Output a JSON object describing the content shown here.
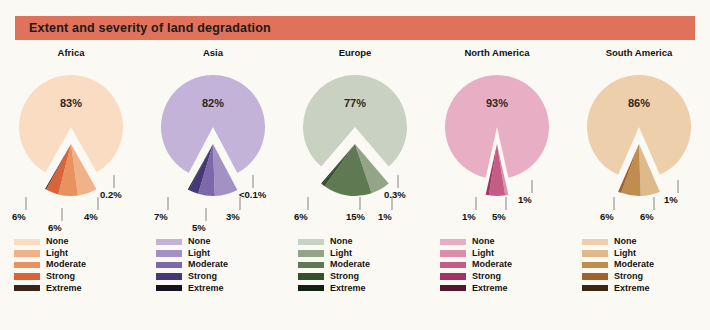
{
  "header": {
    "title": "Extent and severity of land degradation"
  },
  "legend_labels": [
    "None",
    "Light",
    "Moderate",
    "Strong",
    "Extreme"
  ],
  "chart_data": [
    {
      "type": "pie",
      "title": "Africa",
      "categories": [
        "None",
        "Light",
        "Moderate",
        "Strong",
        "Extreme"
      ],
      "values": [
        83,
        6,
        6,
        4,
        0.2
      ],
      "value_labels": [
        "83%",
        "6%",
        "6%",
        "4%",
        "0.2%"
      ],
      "colors": [
        "#fadcc3",
        "#f0b288",
        "#e8925f",
        "#d9643a",
        "#3a2318"
      ],
      "legend_colors": [
        "#fadcc3",
        "#f0b288",
        "#e8925f",
        "#d9643a",
        "#3a2318"
      ]
    },
    {
      "type": "pie",
      "title": "Asia",
      "categories": [
        "None",
        "Light",
        "Moderate",
        "Strong",
        "Extreme"
      ],
      "values": [
        82,
        7,
        5,
        3,
        0.05
      ],
      "value_labels": [
        "82%",
        "7%",
        "5%",
        "3%",
        "<0.1%"
      ],
      "colors": [
        "#c3b3d8",
        "#a391c4",
        "#7c69aa",
        "#443a7a",
        "#14121f"
      ],
      "legend_colors": [
        "#c3b3d8",
        "#a391c4",
        "#7c69aa",
        "#443a7a",
        "#14121f"
      ]
    },
    {
      "type": "pie",
      "title": "Europe",
      "categories": [
        "None",
        "Light",
        "Moderate",
        "Strong",
        "Extreme"
      ],
      "values": [
        77,
        6,
        15,
        1,
        0.3
      ],
      "value_labels": [
        "77%",
        "6%",
        "15%",
        "1%",
        "0.3%"
      ],
      "colors": [
        "#c9d2c2",
        "#94a587",
        "#5f7a52",
        "#33512c",
        "#13200f"
      ],
      "legend_colors": [
        "#c9d2c2",
        "#94a587",
        "#5f7a52",
        "#33512c",
        "#13200f"
      ]
    },
    {
      "type": "pie",
      "title": "North America",
      "categories": [
        "None",
        "Light",
        "Moderate",
        "Strong",
        "Extreme"
      ],
      "values": [
        93,
        1,
        5,
        1,
        0
      ],
      "value_labels": [
        "93%",
        "1%",
        "5%",
        "1%",
        ""
      ],
      "colors": [
        "#e8aec4",
        "#d98fac",
        "#c45d86",
        "#a33464",
        "#54162c"
      ],
      "legend_colors": [
        "#e8aec4",
        "#d98fac",
        "#c45d86",
        "#a33464",
        "#54162c"
      ]
    },
    {
      "type": "pie",
      "title": "South America",
      "categories": [
        "None",
        "Light",
        "Moderate",
        "Strong",
        "Extreme"
      ],
      "values": [
        86,
        6,
        6,
        1,
        0
      ],
      "value_labels": [
        "86%",
        "6%",
        "6%",
        "1%",
        ""
      ],
      "colors": [
        "#edcfac",
        "#ddb98c",
        "#c08d4e",
        "#a0622a",
        "#3a2614"
      ],
      "legend_colors": [
        "#edcfac",
        "#ddb98c",
        "#c08d4e",
        "#a0622a",
        "#3a2614"
      ]
    }
  ],
  "callouts": [
    [
      {
        "text": "6%",
        "x": 12,
        "y": 150
      },
      {
        "text": "6%",
        "x": 48,
        "y": 161
      },
      {
        "text": "4%",
        "x": 84,
        "y": 150
      },
      {
        "text": "0.2%",
        "x": 100,
        "y": 128
      }
    ],
    [
      {
        "text": "7%",
        "x": 12,
        "y": 150
      },
      {
        "text": "5%",
        "x": 50,
        "y": 161
      },
      {
        "text": "3%",
        "x": 84,
        "y": 150
      },
      {
        "text": "<0.1%",
        "x": 97,
        "y": 128
      }
    ],
    [
      {
        "text": "6%",
        "x": 10,
        "y": 150
      },
      {
        "text": "15%",
        "x": 62,
        "y": 150
      },
      {
        "text": "1%",
        "x": 94,
        "y": 150
      },
      {
        "text": "0.3%",
        "x": 100,
        "y": 128
      }
    ],
    [
      {
        "text": "1%",
        "x": 36,
        "y": 150
      },
      {
        "text": "5%",
        "x": 66,
        "y": 150
      },
      {
        "text": "1%",
        "x": 92,
        "y": 133
      }
    ],
    [
      {
        "text": "6%",
        "x": 32,
        "y": 150
      },
      {
        "text": "6%",
        "x": 72,
        "y": 150
      },
      {
        "text": "1%",
        "x": 96,
        "y": 133
      }
    ]
  ]
}
